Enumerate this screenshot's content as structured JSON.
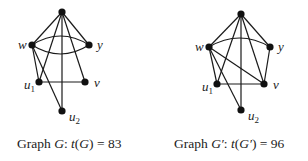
{
  "graphs": [
    {
      "id": "G",
      "caption": {
        "prefix": "Graph ",
        "name": "G",
        "colon": ": ",
        "func": "t",
        "open": "(",
        "arg": "G",
        "close": ")",
        "eq": " = ",
        "value": "83"
      },
      "nodes": [
        {
          "id": "top",
          "label": "",
          "x": 62,
          "y": 12
        },
        {
          "id": "w",
          "label": "w",
          "x": 32,
          "y": 45
        },
        {
          "id": "y",
          "label": "y",
          "x": 89,
          "y": 45
        },
        {
          "id": "u1",
          "label": "u",
          "sub": "1",
          "x": 39,
          "y": 82
        },
        {
          "id": "v",
          "label": "v",
          "x": 85,
          "y": 82
        },
        {
          "id": "u2",
          "label": "u",
          "sub": "2",
          "x": 62,
          "y": 111
        }
      ],
      "edges": [
        [
          "top",
          "w"
        ],
        [
          "top",
          "y"
        ],
        [
          "top",
          "u1"
        ],
        [
          "top",
          "v"
        ],
        [
          "top",
          "u2"
        ],
        [
          "w",
          "y",
          "arc-up"
        ],
        [
          "w",
          "y",
          "arc-down"
        ],
        [
          "w",
          "u1"
        ],
        [
          "w",
          "u2"
        ],
        [
          "u1",
          "v"
        ]
      ]
    },
    {
      "id": "G'",
      "caption": {
        "prefix": "Graph ",
        "name": "G′",
        "colon": ": ",
        "func": "t",
        "open": "(",
        "arg": "G′",
        "close": ")",
        "eq": " = ",
        "value": "96"
      },
      "nodes": [
        {
          "id": "top",
          "label": "",
          "x": 241,
          "y": 14
        },
        {
          "id": "w",
          "label": "w",
          "x": 209,
          "y": 47
        },
        {
          "id": "y",
          "label": "y",
          "x": 270,
          "y": 47
        },
        {
          "id": "u1",
          "label": "u",
          "sub": "1",
          "x": 217,
          "y": 84
        },
        {
          "id": "v",
          "label": "v",
          "x": 264,
          "y": 84
        },
        {
          "id": "u2",
          "label": "u",
          "sub": "2",
          "x": 241,
          "y": 110
        }
      ],
      "edges": [
        [
          "top",
          "w"
        ],
        [
          "top",
          "y"
        ],
        [
          "top",
          "u1"
        ],
        [
          "top",
          "v"
        ],
        [
          "top",
          "u2"
        ],
        [
          "w",
          "y",
          "arc-up"
        ],
        [
          "w",
          "u1"
        ],
        [
          "w",
          "u2"
        ],
        [
          "w",
          "v"
        ],
        [
          "y",
          "v"
        ],
        [
          "u1",
          "v"
        ]
      ]
    }
  ],
  "colors": {
    "edge": "#1a1a1a",
    "node": "#111111",
    "text": "#222222"
  }
}
